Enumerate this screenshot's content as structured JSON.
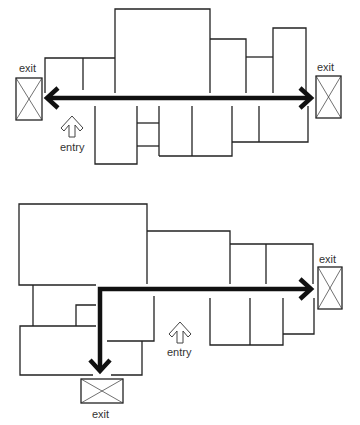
{
  "diagrams": [
    {
      "id": "floor-plan-straight-route",
      "labels": {
        "exit_left": "exit",
        "exit_right": "exit",
        "entry": "entry"
      },
      "route": "horizontal double-headed arrow between left and right exits"
    },
    {
      "id": "floor-plan-l-route",
      "labels": {
        "exit_right": "exit",
        "exit_bottom": "exit",
        "entry": "entry"
      },
      "route": "L-shaped double-headed arrow between bottom exit and right exit"
    }
  ],
  "colors": {
    "wall": "#222222",
    "route": "#111111",
    "background": "#ffffff"
  }
}
